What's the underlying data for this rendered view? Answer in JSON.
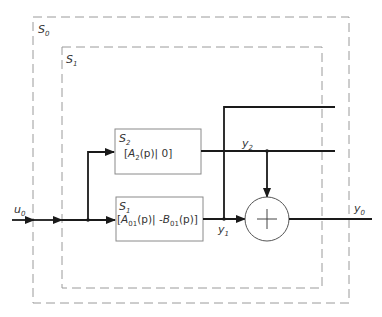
{
  "diagram": {
    "type": "block-diagram",
    "colors": {
      "line": "#1a1a1a",
      "dashed_border": "#9a9a9a",
      "block_border": "#8a8a8a",
      "text": "#333333"
    },
    "systems": {
      "outer": {
        "label": "S",
        "subscript": "0"
      },
      "inner": {
        "label": "S",
        "subscript": "1"
      }
    },
    "blocks": [
      {
        "id": "S2",
        "title": "S",
        "title_sub": "2",
        "expr_open": "[",
        "expr_A": "A",
        "expr_A_sub": "2",
        "expr_rest": "(p)| 0]"
      },
      {
        "id": "S1",
        "title": "S",
        "title_sub": "1",
        "expr_open": "[",
        "expr_A": "A",
        "expr_A_sub": "01",
        "expr_mid": "(p)| -",
        "expr_B": "B",
        "expr_B_sub": "01",
        "expr_rest": "(p)]"
      }
    ],
    "signals": {
      "input": {
        "label": "u",
        "sub": "0"
      },
      "y1": {
        "label": "y",
        "sub": "1"
      },
      "y2": {
        "label": "y",
        "sub": "2"
      },
      "output": {
        "label": "y",
        "sub": "0"
      }
    },
    "summing_junction": {
      "symbol": "+"
    }
  }
}
